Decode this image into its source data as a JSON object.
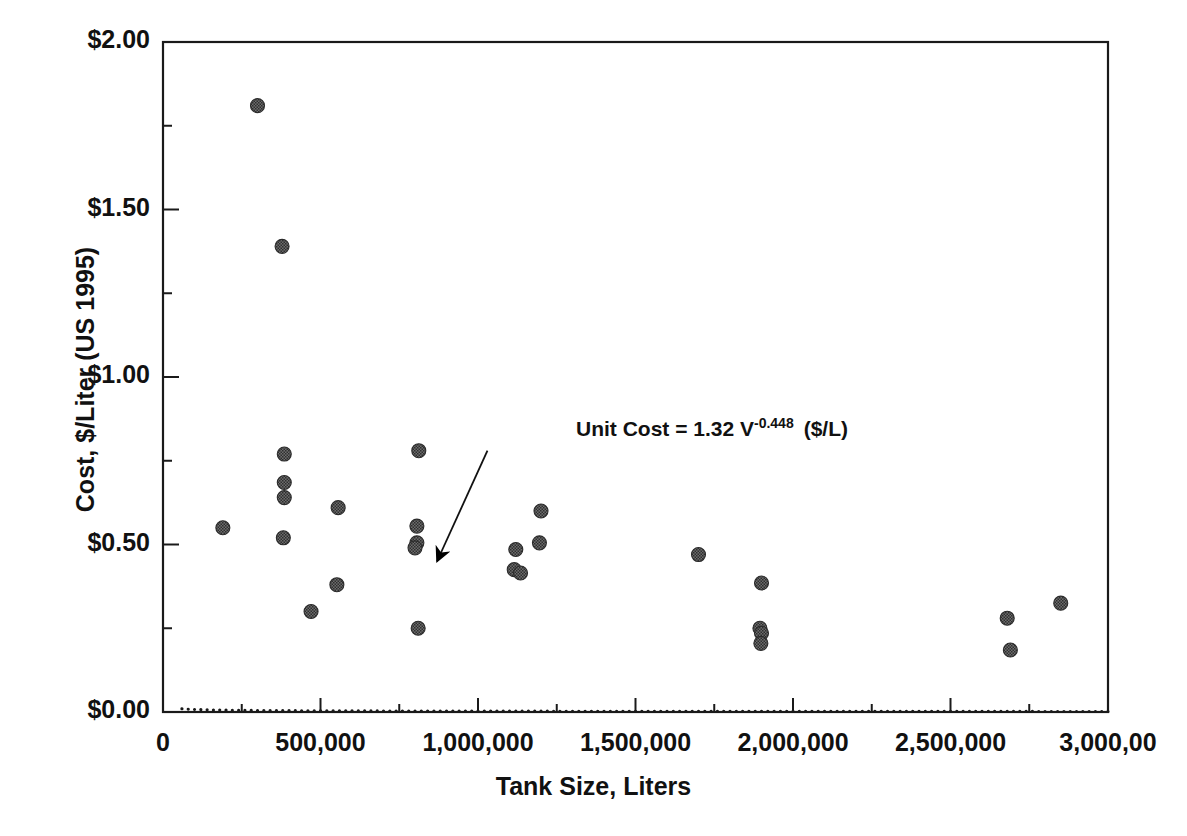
{
  "chart_data": {
    "type": "scatter",
    "title": "",
    "xlabel": "Tank Size, Liters",
    "ylabel": "Cost, $/Liter (US 1995)",
    "xlim": [
      0,
      3000000
    ],
    "ylim": [
      0,
      2.0
    ],
    "grid": false,
    "legend": null,
    "xticks": [
      {
        "value": 0,
        "label": "0"
      },
      {
        "value": 500000,
        "label": "500,000"
      },
      {
        "value": 1000000,
        "label": "1,000,000"
      },
      {
        "value": 1500000,
        "label": "1,500,000"
      },
      {
        "value": 2000000,
        "label": "2,000,000"
      },
      {
        "value": 2500000,
        "label": "2,500,000"
      },
      {
        "value": 3000000,
        "label": "3,000,00"
      }
    ],
    "xminor_ticks": [
      250000,
      750000,
      1250000,
      1750000,
      2250000,
      2750000
    ],
    "yticks": [
      {
        "value": 0.0,
        "label": "$0.00"
      },
      {
        "value": 0.5,
        "label": "$0.50"
      },
      {
        "value": 1.0,
        "label": "$1.00"
      },
      {
        "value": 1.5,
        "label": "$1.50"
      },
      {
        "value": 2.0,
        "label": "$2.00"
      }
    ],
    "yminor_ticks": [
      0.25,
      0.75,
      1.25,
      1.75
    ],
    "marker": {
      "shape": "circle",
      "diameter_px": 14,
      "fill": "#4a4a4a",
      "pattern": "dithered-checker",
      "edge": "#2b2b2b"
    },
    "points": [
      {
        "x": 190000,
        "y": 0.55
      },
      {
        "x": 300000,
        "y": 1.81
      },
      {
        "x": 378000,
        "y": 1.39
      },
      {
        "x": 385000,
        "y": 0.77
      },
      {
        "x": 385000,
        "y": 0.685
      },
      {
        "x": 385000,
        "y": 0.64
      },
      {
        "x": 382000,
        "y": 0.52
      },
      {
        "x": 470000,
        "y": 0.3
      },
      {
        "x": 556000,
        "y": 0.61
      },
      {
        "x": 552000,
        "y": 0.38
      },
      {
        "x": 812000,
        "y": 0.78
      },
      {
        "x": 806000,
        "y": 0.555
      },
      {
        "x": 806000,
        "y": 0.505
      },
      {
        "x": 800000,
        "y": 0.49
      },
      {
        "x": 810000,
        "y": 0.25
      },
      {
        "x": 1120000,
        "y": 0.485
      },
      {
        "x": 1115000,
        "y": 0.425
      },
      {
        "x": 1135000,
        "y": 0.415
      },
      {
        "x": 1200000,
        "y": 0.6
      },
      {
        "x": 1195000,
        "y": 0.505
      },
      {
        "x": 1700000,
        "y": 0.47
      },
      {
        "x": 1900000,
        "y": 0.385
      },
      {
        "x": 1895000,
        "y": 0.25
      },
      {
        "x": 1900000,
        "y": 0.235
      },
      {
        "x": 1898000,
        "y": 0.205
      },
      {
        "x": 2680000,
        "y": 0.28
      },
      {
        "x": 2690000,
        "y": 0.185
      },
      {
        "x": 2850000,
        "y": 0.325
      }
    ],
    "trend": {
      "label": "Unit Cost = 1.32 V -0.448 ($/L)",
      "equation_prefix": "Unit Cost = 1.32 V",
      "equation_exponent": "-0.448",
      "equation_suffix": "($/L)",
      "coefficient": 1.32,
      "exponent": -0.448,
      "style": "dotted",
      "color": "#1a1a1a",
      "x_start": 60000,
      "x_end": 3000000
    },
    "annotation_arrow": {
      "from_x": 1030000,
      "from_y": 0.78,
      "to_x": 870000,
      "to_y": 0.45
    }
  }
}
